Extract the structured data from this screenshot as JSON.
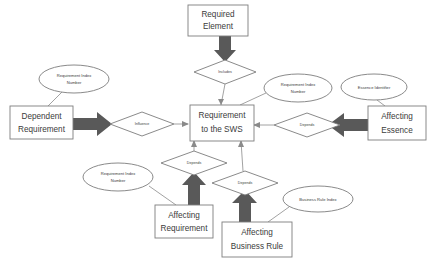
{
  "diagram": {
    "type": "entity-relationship-diagram",
    "colors": {
      "background": "#ffffff",
      "shape_fill": "#ffffff",
      "shape_stroke": "#7d7d7d",
      "block_arrow": "#595959",
      "text": "#3b3b3b",
      "connector_line": "#8a8a8a"
    },
    "entities": [
      {
        "id": "required-element",
        "label_line1": "Required",
        "label_line2": "Element",
        "x": 188,
        "y": 5,
        "w": 60,
        "h": 31
      },
      {
        "id": "requirement-to-the-sws",
        "label_line1": "Requirement",
        "label_line2": "to the SWS",
        "x": 190,
        "y": 105,
        "w": 62,
        "h": 34
      },
      {
        "id": "dependent-requirement",
        "label_line1": "Dependent",
        "label_line2": "Requirement",
        "x": 10,
        "y": 106,
        "w": 63,
        "h": 32
      },
      {
        "id": "affecting-essence",
        "label_line1": "Affecting",
        "label_line2": "Essence",
        "x": 368,
        "y": 106,
        "w": 58,
        "h": 33
      },
      {
        "id": "affecting-requirement",
        "label_line1": "Affecting",
        "label_line2": "Requirement",
        "x": 155,
        "y": 205,
        "w": 58,
        "h": 32
      },
      {
        "id": "affecting-business-rule",
        "label_line1": "Affecting",
        "label_line2": "Business Rule",
        "x": 222,
        "y": 222,
        "w": 70,
        "h": 34
      }
    ],
    "relationships": [
      {
        "id": "includes",
        "label": "Includes",
        "cx": 225,
        "cy": 72,
        "rx": 31,
        "ry": 12
      },
      {
        "id": "influence",
        "label": "Influence",
        "cx": 142,
        "cy": 124,
        "rx": 32,
        "ry": 12
      },
      {
        "id": "depends-essence",
        "label": "Depends",
        "cx": 307,
        "cy": 125,
        "rx": 33,
        "ry": 12
      },
      {
        "id": "depends-requirement",
        "label": "Depends",
        "cx": 194,
        "cy": 163,
        "rx": 33,
        "ry": 12
      },
      {
        "id": "depends-business-rule",
        "label": "Depends",
        "cx": 245,
        "cy": 183,
        "rx": 33,
        "ry": 12
      }
    ],
    "attributes": [
      {
        "id": "requirement-index-number-left",
        "label_line1": "Requirement Index",
        "label_line2": "Number",
        "cx": 74,
        "cy": 79,
        "rx": 35,
        "ry": 14
      },
      {
        "id": "requirement-index-number-right",
        "label_line1": "Requirement Index",
        "label_line2": "Number",
        "cx": 298,
        "cy": 88,
        "rx": 34,
        "ry": 14
      },
      {
        "id": "essence-identifier",
        "label_line1": "Essence Identifier",
        "label_line2": "",
        "cx": 374,
        "cy": 87,
        "rx": 33,
        "ry": 13
      },
      {
        "id": "requirement-index-number-bottom",
        "label_line1": "Requirement Index",
        "label_line2": "Number",
        "cx": 118,
        "cy": 177,
        "rx": 35,
        "ry": 14
      },
      {
        "id": "business-rule-index",
        "label_line1": "Business Rule Index",
        "label_line2": "",
        "cx": 318,
        "cy": 199,
        "rx": 35,
        "ry": 13
      }
    ]
  }
}
